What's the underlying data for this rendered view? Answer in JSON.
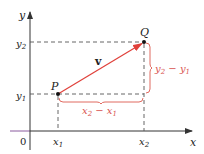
{
  "figure": {
    "axes": {
      "x_label": "x",
      "y_label": "y",
      "origin_label": "0"
    },
    "ticks": {
      "x1": {
        "base": "x",
        "sub": "1"
      },
      "x2": {
        "base": "x",
        "sub": "2"
      },
      "y1": {
        "base": "y",
        "sub": "1"
      },
      "y2": {
        "base": "y",
        "sub": "2"
      }
    },
    "points": {
      "P": "P",
      "Q": "Q"
    },
    "vector_label": "v",
    "brackets": {
      "horizontal": {
        "a": "x",
        "a_sub": "2",
        "op": " − ",
        "b": "x",
        "b_sub": "1"
      },
      "vertical": {
        "a": "y",
        "a_sub": "2",
        "op": " − ",
        "b": "y",
        "b_sub": "1"
      }
    },
    "colors": {
      "axis": "#333333",
      "axis_left_tint": "#8a5a9e",
      "vector": "#e0403a",
      "bracket": "#e06a60",
      "dashed": "#555555",
      "point": "#111111"
    }
  }
}
